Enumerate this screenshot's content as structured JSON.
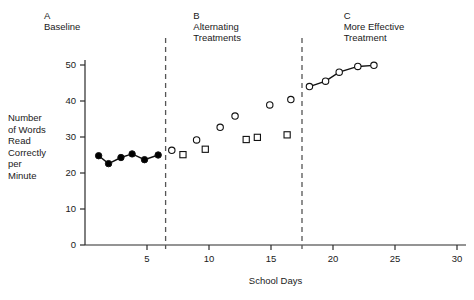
{
  "chart_data": {
    "type": "scatter",
    "title": "",
    "xlabel": "School Days",
    "ylabel": "Number of Words Read Correctly per Minute",
    "ylabel_lines": [
      "Number",
      "of Words",
      "Read",
      "Correctly",
      "per",
      "Minute"
    ],
    "xlim": [
      0,
      31
    ],
    "ylim": [
      0,
      52
    ],
    "grid": false,
    "legend": "none",
    "x_ticks": [
      5,
      10,
      15,
      20,
      25,
      30
    ],
    "y_ticks": [
      0,
      10,
      20,
      30,
      40,
      50
    ],
    "phases": [
      {
        "letter": "A",
        "name_lines": [
          "Baseline"
        ],
        "name": "Baseline",
        "x_center": 15.6,
        "divider_after": 17.5
      },
      {
        "letter": "B",
        "name_lines": [
          "Alternating",
          "Treatments"
        ],
        "name": "Alternating Treatments",
        "x_center": 48.8,
        "divider_after": 78.0
      },
      {
        "letter": "C",
        "name_lines": [
          "More Effective",
          "Treatment"
        ],
        "name": "More Effective Treatment",
        "x_center": 82.0,
        "divider_after": null
      }
    ],
    "dividers": [
      6.5,
      17.5
    ],
    "series": [
      {
        "name": "Baseline (filled circles, connected)",
        "marker": "filled-circle",
        "connected": true,
        "points": [
          {
            "x": 1.1,
            "y": 24.8
          },
          {
            "x": 1.9,
            "y": 22.6
          },
          {
            "x": 2.9,
            "y": 24.3
          },
          {
            "x": 3.8,
            "y": 25.3
          },
          {
            "x": 4.8,
            "y": 23.7
          },
          {
            "x": 5.9,
            "y": 25.0
          }
        ]
      },
      {
        "name": "Alternating Treatments - Treatment 1 (open circles)",
        "marker": "open-circle",
        "connected": false,
        "points": [
          {
            "x": 7.0,
            "y": 26.3
          },
          {
            "x": 9.0,
            "y": 29.2
          },
          {
            "x": 10.9,
            "y": 32.7
          },
          {
            "x": 12.1,
            "y": 35.8
          },
          {
            "x": 14.9,
            "y": 38.9
          },
          {
            "x": 16.6,
            "y": 40.4
          }
        ]
      },
      {
        "name": "Alternating Treatments - Treatment 2 (open squares)",
        "marker": "open-square",
        "connected": false,
        "points": [
          {
            "x": 7.9,
            "y": 25.1
          },
          {
            "x": 9.7,
            "y": 26.6
          },
          {
            "x": 13.0,
            "y": 29.3
          },
          {
            "x": 13.9,
            "y": 29.9
          },
          {
            "x": 16.3,
            "y": 30.6
          }
        ]
      },
      {
        "name": "More Effective Treatment (open circles, connected)",
        "marker": "open-circle",
        "connected": true,
        "points": [
          {
            "x": 18.1,
            "y": 44.0
          },
          {
            "x": 19.4,
            "y": 45.5
          },
          {
            "x": 20.5,
            "y": 48.0
          },
          {
            "x": 22.0,
            "y": 49.6
          },
          {
            "x": 23.3,
            "y": 49.9
          }
        ]
      }
    ],
    "colors": {
      "axis": "#2b2b2b",
      "marker_stroke": "#111111",
      "marker_fill_open": "#ffffff",
      "marker_fill_solid": "#000000",
      "divider": "#555555",
      "text": "#1a1a1a",
      "background": "#ffffff"
    }
  }
}
